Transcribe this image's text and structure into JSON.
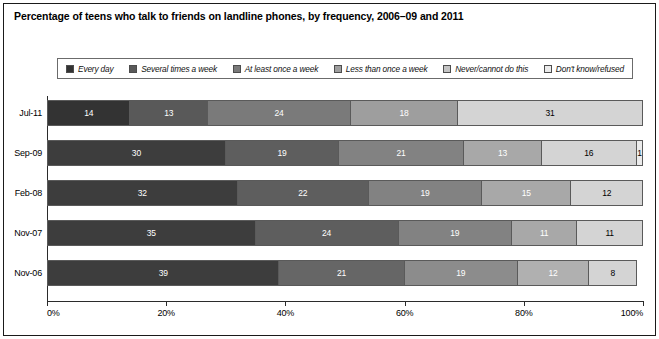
{
  "title": "Percentage of teens who talk to friends on landline phones, by frequency, 2006–09 and 2011",
  "legend": {
    "items": [
      {
        "label": "Every day",
        "color": "#333333"
      },
      {
        "label": "Several times a week",
        "color": "#595959"
      },
      {
        "label": "At least once a week",
        "color": "#7a7a7a"
      },
      {
        "label": "Less than once a week",
        "color": "#9e9e9e"
      },
      {
        "label": "Never/cannot do this",
        "color": "#c4c4c4"
      },
      {
        "label": "Don't know/refused",
        "color": "#ebebeb"
      }
    ]
  },
  "axis": {
    "ticks": [
      "0%",
      "20%",
      "40%",
      "60%",
      "80%",
      "100%"
    ],
    "tick_values": [
      0,
      20,
      40,
      60,
      80,
      100
    ]
  },
  "chart_data": {
    "type": "bar",
    "title": "Percentage of teens who talk to friends on landline phones, by frequency, 2006–09 and 2011",
    "orientation": "horizontal",
    "stacked": true,
    "stack_mode": "percent",
    "xlabel": "",
    "ylabel": "",
    "xlim": [
      0,
      100
    ],
    "grid": false,
    "legend_position": "top",
    "categories": [
      "Jul-11",
      "Sep-09",
      "Feb-08",
      "Nov-07",
      "Nov-06"
    ],
    "series": [
      {
        "name": "Every day",
        "color": "#333333",
        "values": [
          14,
          30,
          32,
          35,
          39
        ]
      },
      {
        "name": "Several times a week",
        "color": "#595959",
        "values": [
          13,
          19,
          22,
          24,
          21
        ]
      },
      {
        "name": "At least once a week",
        "color": "#7a7a7a",
        "values": [
          24,
          21,
          19,
          19,
          19
        ]
      },
      {
        "name": "Less than once a week",
        "color": "#9e9e9e",
        "values": [
          18,
          13,
          15,
          11,
          12
        ]
      },
      {
        "name": "Never/cannot do this",
        "color": "#c4c4c4",
        "values": [
          31,
          16,
          12,
          11,
          8
        ]
      },
      {
        "name": "Don't know/refused",
        "color": "#ebebeb",
        "values": [
          0,
          1,
          0,
          0,
          0
        ]
      }
    ],
    "rows": [
      {
        "label": "Jul-11",
        "total": 100,
        "segments": [
          {
            "series": "Every day",
            "value": 14,
            "display": "14",
            "color": "#333333",
            "text_color": "#ffffff"
          },
          {
            "series": "Several times a week",
            "value": 13,
            "display": "13",
            "color": "#595959",
            "text_color": "#ffffff"
          },
          {
            "series": "At least once a week",
            "value": 24,
            "display": "24",
            "color": "#7a7a7a",
            "text_color": "#ffffff"
          },
          {
            "series": "Less than once a week",
            "value": 18,
            "display": "18",
            "color": "#9e9e9e",
            "text_color": "#ffffff"
          },
          {
            "series": "Never/cannot do this",
            "value": 31,
            "display": "31",
            "color": "#d4d4d4",
            "text_color": "#000000"
          }
        ]
      },
      {
        "label": "Sep-09",
        "total": 100,
        "segments": [
          {
            "series": "Every day",
            "value": 30,
            "display": "30",
            "color": "#3d3d3d",
            "text_color": "#ffffff"
          },
          {
            "series": "Several times a week",
            "value": 19,
            "display": "19",
            "color": "#5e5e5e",
            "text_color": "#ffffff"
          },
          {
            "series": "At least once a week",
            "value": 21,
            "display": "21",
            "color": "#828282",
            "text_color": "#ffffff"
          },
          {
            "series": "Less than once a week",
            "value": 13,
            "display": "13",
            "color": "#a8a8a8",
            "text_color": "#ffffff"
          },
          {
            "series": "Never/cannot do this",
            "value": 16,
            "display": "16",
            "color": "#d4d4d4",
            "text_color": "#000000"
          },
          {
            "series": "Don't know/refused",
            "value": 1,
            "display": "1",
            "color": "#ebebeb",
            "text_color": "#000000"
          }
        ]
      },
      {
        "label": "Feb-08",
        "total": 100,
        "segments": [
          {
            "series": "Every day",
            "value": 32,
            "display": "32",
            "color": "#3d3d3d",
            "text_color": "#ffffff"
          },
          {
            "series": "Several times a week",
            "value": 22,
            "display": "22",
            "color": "#5e5e5e",
            "text_color": "#ffffff"
          },
          {
            "series": "At least once a week",
            "value": 19,
            "display": "19",
            "color": "#828282",
            "text_color": "#ffffff"
          },
          {
            "series": "Less than once a week",
            "value": 15,
            "display": "15",
            "color": "#a8a8a8",
            "text_color": "#ffffff"
          },
          {
            "series": "Never/cannot do this",
            "value": 12,
            "display": "12",
            "color": "#d4d4d4",
            "text_color": "#000000"
          }
        ]
      },
      {
        "label": "Nov-07",
        "total": 100,
        "segments": [
          {
            "series": "Every day",
            "value": 35,
            "display": "35",
            "color": "#3d3d3d",
            "text_color": "#ffffff"
          },
          {
            "series": "Several times a week",
            "value": 24,
            "display": "24",
            "color": "#5e5e5e",
            "text_color": "#ffffff"
          },
          {
            "series": "At least once a week",
            "value": 19,
            "display": "19",
            "color": "#828282",
            "text_color": "#ffffff"
          },
          {
            "series": "Less than once a week",
            "value": 11,
            "display": "11",
            "color": "#a8a8a8",
            "text_color": "#ffffff"
          },
          {
            "series": "Never/cannot do this",
            "value": 11,
            "display": "11",
            "color": "#d4d4d4",
            "text_color": "#000000"
          }
        ]
      },
      {
        "label": "Nov-06",
        "total": 99,
        "segments": [
          {
            "series": "Every day",
            "value": 39,
            "display": "39",
            "color": "#3d3d3d",
            "text_color": "#ffffff"
          },
          {
            "series": "Several times a week",
            "value": 21,
            "display": "21",
            "color": "#666666",
            "text_color": "#ffffff"
          },
          {
            "series": "At least once a week",
            "value": 19,
            "display": "19",
            "color": "#8c8c8c",
            "text_color": "#ffffff"
          },
          {
            "series": "Less than once a week",
            "value": 12,
            "display": "12",
            "color": "#b0b0b0",
            "text_color": "#ffffff"
          },
          {
            "series": "Never/cannot do this",
            "value": 8,
            "display": "8",
            "color": "#d4d4d4",
            "text_color": "#000000"
          }
        ]
      }
    ]
  }
}
